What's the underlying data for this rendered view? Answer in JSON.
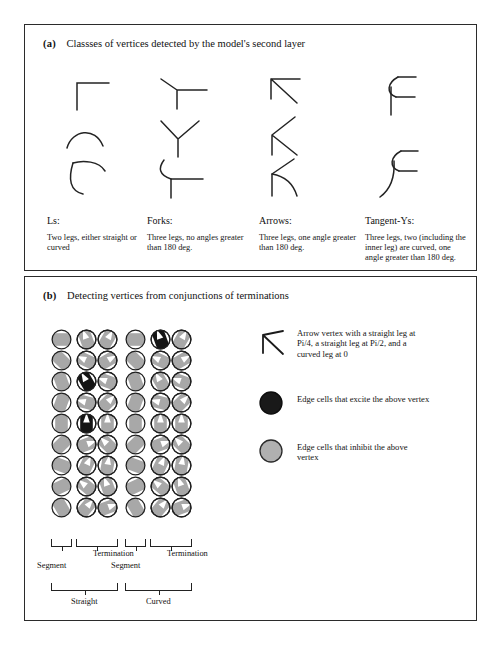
{
  "running_head": "",
  "figure": {
    "panel_a": {
      "tag": "(a)",
      "heading": "Classses of vertices detected by the model's second layer",
      "columns": [
        {
          "id": "ls",
          "title": "Ls:",
          "description": "Two legs, either straight or curved",
          "glyph_count": 3,
          "glyphs": [
            "corner-right-angle",
            "arc-open-down",
            "curved-L"
          ]
        },
        {
          "id": "forks",
          "title": "Forks:",
          "description": "Three legs, no angles greater than 180 deg.",
          "glyph_count": 3,
          "glyphs": [
            "fork-T-oblique",
            "fork-Y",
            "fork-curved-T"
          ]
        },
        {
          "id": "arrows",
          "title": "Arrows:",
          "description": "Three legs, one angle greater than 180 deg.",
          "glyph_count": 3,
          "glyphs": [
            "arrow-up-left",
            "arrow-K-left",
            "arrow-K-curved"
          ]
        },
        {
          "id": "tangent-ys",
          "title": "Tangent-Ys:",
          "description": "Three legs, two (including the inner leg) are curved, one angle greater than 180 deg.",
          "glyph_count": 2,
          "glyphs": [
            "tangent-y-straight-stem",
            "tangent-y-curved-stem"
          ]
        }
      ]
    },
    "panel_b": {
      "tag": "(b)",
      "heading": "Detecting vertices from conjunctions of terminations",
      "grid": {
        "columns": 6,
        "rows": 9,
        "cell_fill_inhibit": "#a8a8a8",
        "cell_fill_excite": "#151515",
        "cell_outline": "#1f1f1f",
        "excitatory_cells": [
          [
            5,
            1
          ],
          [
            2,
            3
          ],
          [
            2,
            5
          ]
        ],
        "orientations_deg": [
          [
            0,
            70,
            120,
            0,
            70,
            120
          ],
          [
            45,
            25,
            150,
            45,
            25,
            150
          ],
          [
            70,
            60,
            20,
            70,
            60,
            20
          ],
          [
            110,
            15,
            135,
            110,
            15,
            135
          ],
          [
            90,
            90,
            90,
            90,
            90,
            90
          ],
          [
            135,
            160,
            45,
            135,
            160,
            45
          ],
          [
            20,
            115,
            100,
            20,
            115,
            100
          ],
          [
            155,
            40,
            70,
            155,
            40,
            70
          ],
          [
            60,
            130,
            160,
            60,
            130,
            160
          ]
        ],
        "notch_columns": [
          2,
          3,
          5,
          6
        ]
      },
      "brackets": {
        "row1": [
          {
            "label": "Segment",
            "span_start": 1,
            "span_end": 1
          },
          {
            "label": "Termination",
            "span_start": 2,
            "span_end": 3
          },
          {
            "label": "Segment",
            "span_start": 4,
            "span_end": 4
          },
          {
            "label": "Termination",
            "span_start": 5,
            "span_end": 6
          }
        ],
        "row2": [
          {
            "label": "Straight",
            "span_start": 1,
            "span_end": 3
          },
          {
            "label": "Curved",
            "span_start": 4,
            "span_end": 6
          }
        ]
      },
      "legend": [
        {
          "id": "arrow-vertex",
          "swatch": "arrow-vertex-icon",
          "text": "Arrow vertex with a straight leg at Pi/4, a straight leg at Pi/2, and a curved leg at 0"
        },
        {
          "id": "excite",
          "swatch": "filled-dark-circle-icon",
          "text": "Edge cells that excite the above vertex"
        },
        {
          "id": "inhibit",
          "swatch": "filled-gray-circle-icon",
          "text": "Edge cells that inhibit the above vertex"
        }
      ]
    }
  }
}
